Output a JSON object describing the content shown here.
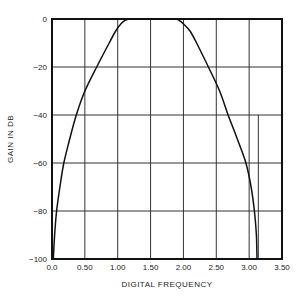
{
  "chart_data": {
    "type": "line",
    "title": "",
    "xlabel": "DIGITAL FREQUENCY",
    "ylabel": "GAIN IN DB",
    "xlim": [
      0.0,
      3.5
    ],
    "ylim": [
      -100,
      0
    ],
    "grid": true,
    "x_ticks": [
      "0.0",
      "0.50",
      "1.00",
      "1.50",
      "2.00",
      "2.50",
      "3.00",
      "3.50"
    ],
    "x_tick_values": [
      0.0,
      0.5,
      1.0,
      1.5,
      2.0,
      2.5,
      3.0,
      3.5
    ],
    "y_ticks": [
      "0",
      "−20",
      "−40",
      "−60",
      "−80",
      "−100"
    ],
    "y_tick_values": [
      0,
      -20,
      -40,
      -60,
      -80,
      -100
    ],
    "extra_vertical_line": 3.14,
    "series": [
      {
        "name": "gain",
        "x": [
          0.02,
          0.04,
          0.07,
          0.12,
          0.18,
          0.27,
          0.37,
          0.5,
          0.68,
          0.87,
          0.97,
          1.05,
          1.12,
          1.2,
          1.5,
          1.85,
          1.93,
          2.0,
          2.1,
          2.2,
          2.38,
          2.55,
          2.68,
          2.82,
          2.95,
          3.03,
          3.08,
          3.11,
          3.12
        ],
        "y": [
          -100,
          -90,
          -80,
          -70,
          -60,
          -50,
          -40,
          -30,
          -20,
          -10,
          -5,
          -2,
          -0.5,
          0,
          0,
          0,
          -0.5,
          -2,
          -5,
          -10,
          -20,
          -30,
          -40,
          -50,
          -60,
          -70,
          -80,
          -90,
          -100
        ]
      }
    ]
  }
}
